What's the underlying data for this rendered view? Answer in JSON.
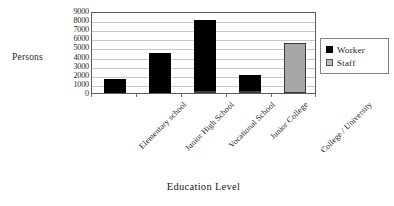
{
  "chart_data": {
    "type": "bar",
    "title": "",
    "subtitle": "",
    "xlabel": "Education Level",
    "ylabel": "Persons",
    "categories": [
      "Elementary school",
      "Junior High School",
      "Vocational School",
      "Junior College",
      "College / University"
    ],
    "series": [
      {
        "name": "Worker",
        "color": "#000000",
        "values": [
          1500,
          4400,
          8000,
          1950,
          0
        ]
      },
      {
        "name": "Staff",
        "color": "#a6a6a6",
        "values": [
          0,
          0,
          200,
          250,
          5500
        ]
      }
    ],
    "ylim": [
      0,
      9000
    ],
    "yticks": [
      0,
      1000,
      2000,
      3000,
      4000,
      5000,
      6000,
      7000,
      8000,
      9000
    ],
    "ytick_labels": [
      "0",
      "1000",
      "2000",
      "3000",
      "4000",
      "5000",
      "6000",
      "7000",
      "8000",
      "9000"
    ],
    "grid": true,
    "grid_axis": "y",
    "legend_position": "right",
    "legend_entries": [
      "Worker",
      "Staff"
    ],
    "bar_mode": "grouped-overlay"
  }
}
